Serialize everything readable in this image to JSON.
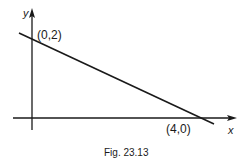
{
  "figure": {
    "caption": "Fig. 23.13",
    "x_axis_label": "x",
    "y_axis_label": "y",
    "points": [
      {
        "label": "(0,2)",
        "x": 0,
        "y": 2
      },
      {
        "label": "(4,0)",
        "x": 4,
        "y": 0
      }
    ],
    "line": {
      "from": [
        0,
        2
      ],
      "to": [
        4,
        0
      ],
      "description": "straight line through intercepts"
    },
    "colors": {
      "ink": "#1a1a1a",
      "background": "#ffffff"
    }
  }
}
